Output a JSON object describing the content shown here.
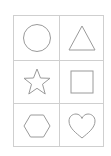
{
  "card": {
    "layout": "3x2 grid",
    "line_color": "#cfcfcf",
    "shape_color": "#9a9a9a",
    "shapes": [
      {
        "name": "circle",
        "row": 0,
        "col": 0
      },
      {
        "name": "triangle",
        "row": 0,
        "col": 1
      },
      {
        "name": "star",
        "row": 1,
        "col": 0
      },
      {
        "name": "square",
        "row": 1,
        "col": 1
      },
      {
        "name": "hexagon",
        "row": 2,
        "col": 0
      },
      {
        "name": "heart",
        "row": 2,
        "col": 1
      }
    ]
  }
}
